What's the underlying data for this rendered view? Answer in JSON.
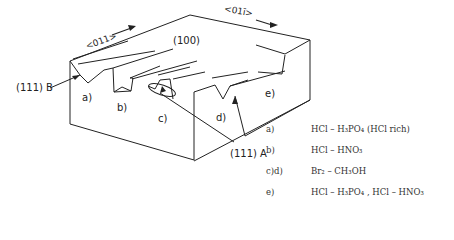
{
  "diagram": {
    "directions": {
      "left": "<011>",
      "right": "<01ī>"
    },
    "face_top": "(100)",
    "face_b": "(111) B",
    "face_a": "(111) A",
    "groove_labels": [
      "a)",
      "b)",
      "c)",
      "d)",
      "e)"
    ]
  },
  "legend": [
    {
      "key": "a)",
      "value": "HCl – H₃PO₄   (HCl rich)"
    },
    {
      "key": "b)",
      "value": "HCl – HNO₃"
    },
    {
      "key": "c)d)",
      "value": "Br₂  – CH₃OH"
    },
    {
      "key": "e)",
      "value": "HCl – H₃PO₄ , HCl – HNO₃"
    }
  ]
}
